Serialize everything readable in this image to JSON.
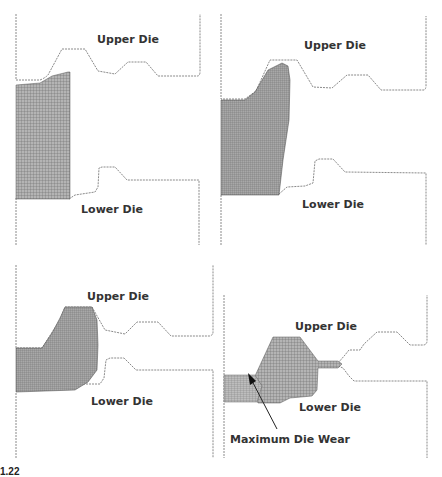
{
  "figure": {
    "panels": [
      {
        "id": "stage-1",
        "upper_label": "Upper Die",
        "lower_label": "Lower Die"
      },
      {
        "id": "stage-2",
        "upper_label": "Upper Die",
        "lower_label": "Lower Die"
      },
      {
        "id": "stage-3",
        "upper_label": "Upper Die",
        "lower_label": "Lower Die"
      },
      {
        "id": "stage-4",
        "upper_label": "Upper Die",
        "lower_label": "Lower Die",
        "annotation": "Maximum Die Wear"
      }
    ],
    "caption_number": "1.22"
  },
  "colors": {
    "die_line": "#8a8a8a",
    "workpiece_fill": "#9a9a9a",
    "text": "#333333"
  }
}
